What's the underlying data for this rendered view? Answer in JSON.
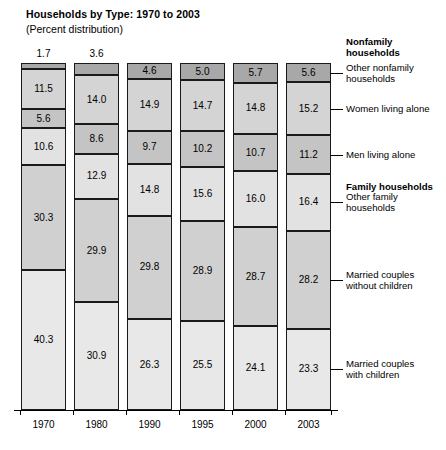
{
  "chart": {
    "title": "Households by Type: 1970 to 2003",
    "subtitle": "(Percent distribution)"
  },
  "chart_data": {
    "type": "bar",
    "subtype": "stacked-bar-100",
    "title": "Households by Type: 1970 to 2003",
    "subtitle": "(Percent distribution)",
    "xlabel": "",
    "ylabel": "",
    "ylim": [
      0,
      100
    ],
    "grid": false,
    "legend_position": "right",
    "categories": [
      "1970",
      "1980",
      "1990",
      "1995",
      "2000",
      "2003"
    ],
    "stack_order_top_to_bottom": [
      "Other nonfamily households",
      "Women living alone",
      "Men living alone",
      "Other family households",
      "Married couples without children",
      "Married couples with children"
    ],
    "series": [
      {
        "name": "Other nonfamily households",
        "group": "Nonfamily households",
        "color": "#a8a8a8",
        "values": [
          1.7,
          3.6,
          4.6,
          5.0,
          5.7,
          5.6
        ]
      },
      {
        "name": "Women living alone",
        "group": "Nonfamily households",
        "color": "#d4d4d4",
        "values": [
          11.5,
          14.0,
          14.9,
          14.7,
          14.8,
          15.2
        ]
      },
      {
        "name": "Men living alone",
        "group": "Nonfamily households",
        "color": "#c4c4c4",
        "values": [
          5.6,
          8.6,
          9.7,
          10.2,
          10.7,
          11.2
        ]
      },
      {
        "name": "Other family households",
        "group": "Family households",
        "color": "#e2e2e2",
        "values": [
          10.6,
          12.9,
          14.8,
          15.6,
          16.0,
          16.4
        ]
      },
      {
        "name": "Married couples without children",
        "group": "Family households",
        "color": "#d0d0d0",
        "values": [
          30.3,
          29.9,
          29.8,
          28.9,
          28.7,
          28.2
        ]
      },
      {
        "name": "Married couples with children",
        "group": "Family households",
        "color": "#e8e8e8",
        "values": [
          40.3,
          30.9,
          26.3,
          25.5,
          24.1,
          23.3
        ]
      }
    ],
    "labels_outside_bar": {
      "1970": [
        "Other nonfamily households"
      ]
    },
    "annotations": []
  },
  "legend": {
    "entries": [
      {
        "text": "Nonfamily\nhouseholds",
        "bold": true,
        "has_leader": false
      },
      {
        "text": "Other nonfamily\nhouseholds",
        "bold": false,
        "has_leader": true
      },
      {
        "text": "Women living alone",
        "bold": false,
        "has_leader": true
      },
      {
        "text": "Men living alone",
        "bold": false,
        "has_leader": true
      },
      {
        "text": "Family households",
        "bold": true,
        "has_leader": false
      },
      {
        "text": "Other family\nhouseholds",
        "bold": false,
        "has_leader": true
      },
      {
        "text": "Married couples\nwithout children",
        "bold": false,
        "has_leader": true
      },
      {
        "text": "Married couples\nwith children",
        "bold": false,
        "has_leader": true
      }
    ]
  },
  "axis": {
    "years": [
      "1970",
      "1980",
      "1990",
      "1995",
      "2000",
      "2003"
    ]
  }
}
